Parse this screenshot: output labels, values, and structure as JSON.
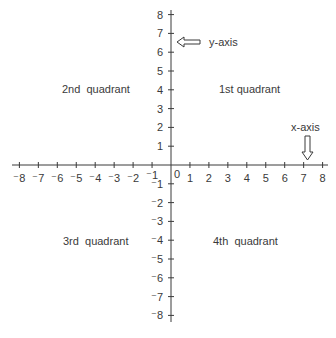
{
  "diagram": {
    "origin_label": "0",
    "x_ticks": [
      "⁻8",
      "⁻7",
      "⁻6",
      "⁻5",
      "⁻4",
      "⁻3",
      "⁻2",
      "⁻1",
      "1",
      "2",
      "3",
      "4",
      "5",
      "6",
      "7",
      "8"
    ],
    "y_ticks_pos": [
      "8",
      "7",
      "6",
      "5",
      "4",
      "3",
      "2",
      "1"
    ],
    "y_ticks_neg": [
      "⁻1",
      "⁻2",
      "⁻3",
      "⁻4",
      "⁻5",
      "⁻6",
      "⁻7",
      "⁻8"
    ],
    "quadrants": {
      "first": "1st quadrant",
      "second": "2nd  quadrant",
      "third": "3rd  quadrant",
      "fourth": "4th  quadrant"
    },
    "annotations": {
      "y_axis_label": "y-axis",
      "x_axis_label": "x-axis"
    },
    "colors": {
      "line": "#3a3a3a",
      "text": "#3a3a3a",
      "background": "#ffffff"
    }
  }
}
